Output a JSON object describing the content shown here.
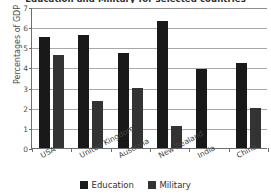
{
  "chart_data": {
    "type": "bar",
    "title": "Education and Military for selected countries",
    "xlabel": "",
    "ylabel": "Percentages of GDP",
    "ylim": [
      0,
      7
    ],
    "yticks": [
      0,
      1,
      2,
      3,
      4,
      5,
      6,
      7
    ],
    "ytick_labels": [
      "0",
      "1",
      "2",
      "3",
      "4",
      "5",
      "6",
      "7"
    ],
    "grid": true,
    "grid_axis": "y",
    "legend_position": "bottom",
    "categories": [
      "USA",
      "United Kingdom",
      "Australia",
      "New Zealand",
      "India",
      "China"
    ],
    "series": [
      {
        "name": "Education",
        "color": "#191919",
        "values": [
          5.5,
          5.6,
          4.7,
          6.3,
          3.9,
          4.2
        ]
      },
      {
        "name": "Military",
        "color": "#333333",
        "values": [
          4.6,
          2.35,
          3.0,
          1.1,
          0.0,
          2.0
        ]
      }
    ]
  },
  "legend": {
    "items": [
      {
        "label": "Education",
        "color": "#191919"
      },
      {
        "label": "Military",
        "color": "#333333"
      }
    ]
  },
  "axis": {
    "y_title": "Percentages of GDP"
  }
}
